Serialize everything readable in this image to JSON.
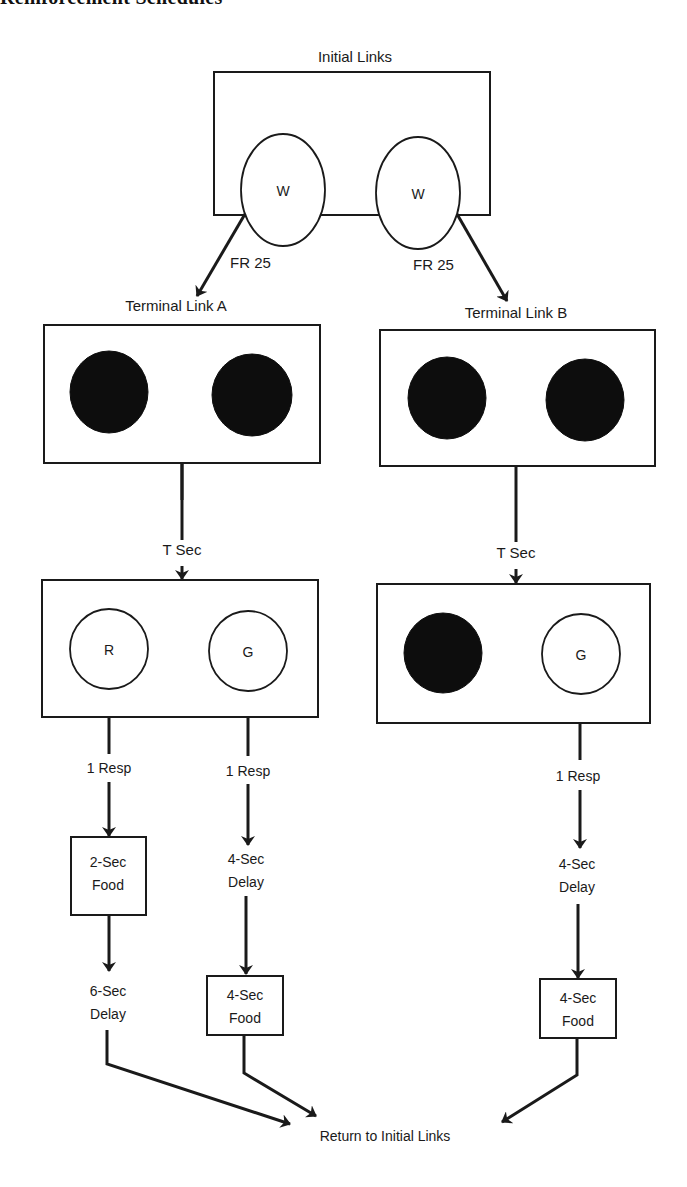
{
  "header": {
    "title": "Reinforcement Schedules"
  },
  "diagram": {
    "initial": {
      "title": "Initial Links",
      "keys": [
        {
          "label": "W",
          "fill": "white"
        },
        {
          "label": "W",
          "fill": "white"
        }
      ]
    },
    "transitions": {
      "left": "FR 25",
      "right": "FR 25"
    },
    "terminal_a": {
      "title": "Terminal Link A",
      "keys": [
        {
          "label": "",
          "fill": "black"
        },
        {
          "label": "",
          "fill": "black"
        }
      ],
      "delay_label": "T Sec",
      "next_keys": [
        {
          "label": "R",
          "fill": "white"
        },
        {
          "label": "G",
          "fill": "white"
        }
      ],
      "branches": [
        {
          "response": "1 Resp",
          "step1": [
            "2-Sec",
            "Food"
          ],
          "step1_boxed": true,
          "step2": [
            "6-Sec",
            "Delay"
          ],
          "step2_boxed": false
        },
        {
          "response": "1 Resp",
          "step1": [
            "4-Sec",
            "Delay"
          ],
          "step1_boxed": false,
          "step2": [
            "4-Sec",
            "Food"
          ],
          "step2_boxed": true
        }
      ]
    },
    "terminal_b": {
      "title": "Terminal Link B",
      "keys": [
        {
          "label": "",
          "fill": "black"
        },
        {
          "label": "",
          "fill": "black"
        }
      ],
      "delay_label": "T Sec",
      "next_keys": [
        {
          "label": "",
          "fill": "black"
        },
        {
          "label": "G",
          "fill": "white"
        }
      ],
      "branches": [
        {
          "response": "1 Resp",
          "step1": [
            "4-Sec",
            "Delay"
          ],
          "step1_boxed": false,
          "step2": [
            "4-Sec",
            "Food"
          ],
          "step2_boxed": true
        }
      ]
    },
    "return_label": "Return to Initial Links"
  },
  "colors": {
    "ink": "#1a1a1a",
    "background": "#ffffff",
    "filled_key": "#0d0d0d"
  }
}
